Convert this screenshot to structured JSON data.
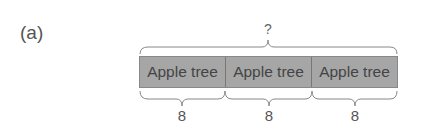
{
  "figure_label": "(a)",
  "total_label": "?",
  "segments": [
    {
      "label": "Apple tree",
      "value": "8"
    },
    {
      "label": "Apple tree",
      "value": "8"
    },
    {
      "label": "Apple tree",
      "value": "8"
    }
  ],
  "colors": {
    "bar_fill": "#a6a6a6",
    "text": "#555555"
  }
}
